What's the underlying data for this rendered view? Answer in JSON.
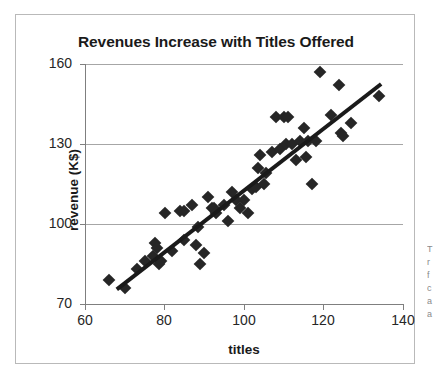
{
  "page": {
    "background_color": "#ffffff",
    "frame_border_color": "#b9b9b9"
  },
  "chart_data": {
    "type": "scatter",
    "title": "Revenues Increase with Titles Offered",
    "xlabel": "titles",
    "ylabel": "revenue (K$)",
    "xlim": [
      60,
      140
    ],
    "ylim": [
      70,
      160
    ],
    "xticks": [
      60,
      80,
      100,
      120,
      140
    ],
    "yticks": [
      70,
      100,
      130,
      160
    ],
    "xtick_labels": [
      "60",
      "80",
      "100",
      "120",
      "140"
    ],
    "ytick_labels": [
      "70",
      "100",
      "130",
      "160"
    ],
    "grid": "horizontal",
    "grid_color": "#a6a6a6",
    "legend": "none",
    "marker": {
      "shape": "diamond",
      "color": "#262626",
      "size_px": 9
    },
    "trendline": {
      "type": "linear",
      "color": "#1a1a1a",
      "width_px": 4,
      "x_start": 68,
      "y_start": 75.5,
      "x_end": 134.5,
      "y_end": 152.5,
      "slope": 1.158,
      "intercept": -3.26
    },
    "points": [
      {
        "x": 66,
        "y": 79
      },
      {
        "x": 70,
        "y": 76
      },
      {
        "x": 73,
        "y": 83
      },
      {
        "x": 75,
        "y": 86
      },
      {
        "x": 77,
        "y": 88
      },
      {
        "x": 77.5,
        "y": 93
      },
      {
        "x": 78,
        "y": 91
      },
      {
        "x": 78.5,
        "y": 85
      },
      {
        "x": 79,
        "y": 86
      },
      {
        "x": 80,
        "y": 104
      },
      {
        "x": 82,
        "y": 90
      },
      {
        "x": 84,
        "y": 105
      },
      {
        "x": 85,
        "y": 105
      },
      {
        "x": 85,
        "y": 94
      },
      {
        "x": 87,
        "y": 107
      },
      {
        "x": 88,
        "y": 92
      },
      {
        "x": 88.5,
        "y": 99
      },
      {
        "x": 89,
        "y": 85
      },
      {
        "x": 90,
        "y": 89
      },
      {
        "x": 91,
        "y": 110
      },
      {
        "x": 92,
        "y": 106
      },
      {
        "x": 92.5,
        "y": 106
      },
      {
        "x": 93,
        "y": 104
      },
      {
        "x": 95,
        "y": 107
      },
      {
        "x": 96,
        "y": 101
      },
      {
        "x": 97,
        "y": 112
      },
      {
        "x": 98,
        "y": 109
      },
      {
        "x": 99,
        "y": 106
      },
      {
        "x": 100,
        "y": 109
      },
      {
        "x": 101,
        "y": 104
      },
      {
        "x": 102,
        "y": 113
      },
      {
        "x": 103,
        "y": 114
      },
      {
        "x": 103.5,
        "y": 121
      },
      {
        "x": 104,
        "y": 126
      },
      {
        "x": 105,
        "y": 115
      },
      {
        "x": 105.5,
        "y": 119
      },
      {
        "x": 107,
        "y": 127
      },
      {
        "x": 108,
        "y": 140
      },
      {
        "x": 109,
        "y": 128
      },
      {
        "x": 110,
        "y": 140
      },
      {
        "x": 110.5,
        "y": 130
      },
      {
        "x": 111,
        "y": 140
      },
      {
        "x": 112,
        "y": 130
      },
      {
        "x": 113,
        "y": 124
      },
      {
        "x": 114,
        "y": 131
      },
      {
        "x": 115,
        "y": 136
      },
      {
        "x": 115.5,
        "y": 125
      },
      {
        "x": 116,
        "y": 131
      },
      {
        "x": 117,
        "y": 115
      },
      {
        "x": 118,
        "y": 131
      },
      {
        "x": 119,
        "y": 157
      },
      {
        "x": 122,
        "y": 141
      },
      {
        "x": 124,
        "y": 152
      },
      {
        "x": 124.5,
        "y": 134
      },
      {
        "x": 125,
        "y": 133
      },
      {
        "x": 127,
        "y": 138
      },
      {
        "x": 134,
        "y": 148
      }
    ]
  },
  "margin_note": {
    "lines": [
      "T",
      "r",
      "f",
      "c",
      "a",
      "a"
    ]
  }
}
